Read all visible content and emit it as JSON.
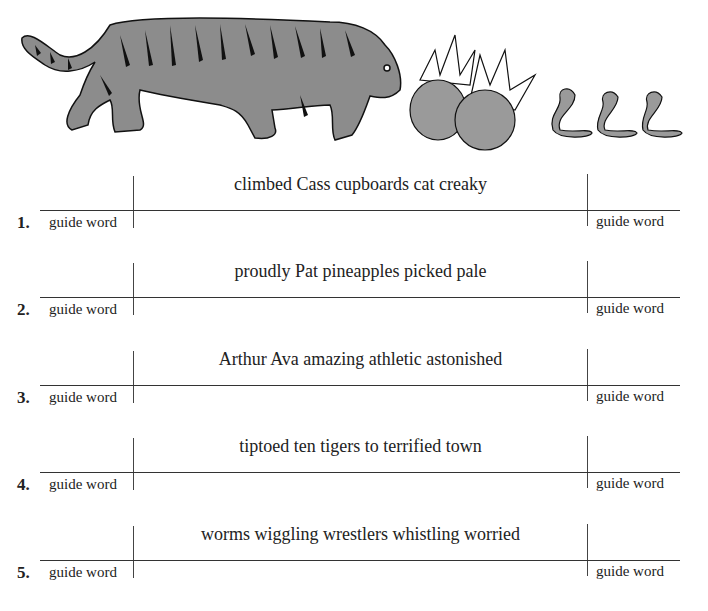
{
  "illustration": {
    "description": "Gray striped tiger sniffing two pineapples, followed by three wiggling worms",
    "elements": [
      "tiger",
      "pineapple",
      "pineapple",
      "worm",
      "worm",
      "worm"
    ]
  },
  "exercises": [
    {
      "number": "1.",
      "words": "climbed Cass cupboards cat creaky",
      "left_label": "guide word",
      "right_label": "guide word"
    },
    {
      "number": "2.",
      "words": "proudly Pat pineapples picked pale",
      "left_label": "guide word",
      "right_label": "guide word"
    },
    {
      "number": "3.",
      "words": "Arthur Ava amazing athletic astonished",
      "left_label": "guide word",
      "right_label": "guide word"
    },
    {
      "number": "4.",
      "words": "tiptoed ten tigers to terrified town",
      "left_label": "guide word",
      "right_label": "guide word"
    },
    {
      "number": "5.",
      "words": "worms wiggling wrestlers whistling worried",
      "left_label": "guide word",
      "right_label": "guide word"
    }
  ]
}
